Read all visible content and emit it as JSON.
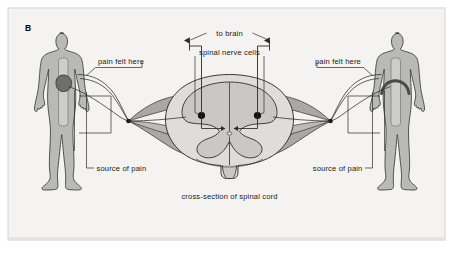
{
  "figure": {
    "panel_label": "B",
    "caption": "cross-section of spinal cord",
    "background_color": "#f4f3f1",
    "frame_border_color": "#d8d6d2",
    "body_fill_color": "#b9b9b7",
    "body_outline_color": "#3a3a3a",
    "spinal_gray_fill": "#c9c8c5",
    "spinal_white_fill": "#dedddb",
    "nerve_band_fill": "#a9a8a5",
    "organ_dark_color": "#6f6e6c",
    "nerve_cell_color": "#111111",
    "line_color": "#2b2b2b",
    "text_color": "#1a1a1a"
  },
  "labels": {
    "to_brain": "to brain",
    "spinal_nerve_cells": "spinal nerve cells",
    "pain_felt_here_left": "pain felt here",
    "pain_felt_here_right": "pain felt here",
    "source_of_pain_left": "source of pain",
    "source_of_pain_right": "source of pain",
    "cross_section": "cross-section of spinal cord"
  },
  "figures": {
    "left": {
      "name": "human-figure-left",
      "organ": "heart",
      "organ_label": "source of pain",
      "referred_site": "pain felt here"
    },
    "right": {
      "name": "human-figure-right",
      "organ": "diaphragm",
      "organ_label": "source of pain",
      "referred_site": "pain felt here"
    }
  },
  "spinal_cord": {
    "name": "spinal-cord-cross-section",
    "structures": [
      "dorsal horn",
      "ventral horn",
      "gray matter",
      "white matter",
      "central canal",
      "spinal nerve cells"
    ],
    "ascending_tracts": 2
  }
}
